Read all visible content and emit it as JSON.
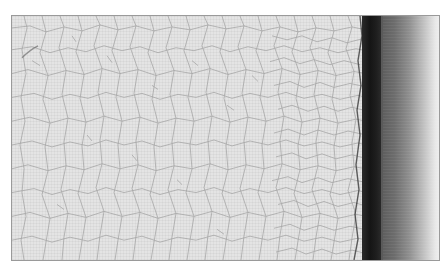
{
  "image": {
    "description": "Grayscale close-up photograph of a crazed/cracked coating surface with a dark vertical band near the right edge fading to a light gradient",
    "caption_partial": "",
    "palette": {
      "surface": "#e4e4e4",
      "crack_lines": "#9c9c9c",
      "dark_band": "#151515",
      "fade_start": "#5e5e5e",
      "fade_end": "#f2f2f2",
      "frame_border": "#9a9a9a"
    }
  }
}
